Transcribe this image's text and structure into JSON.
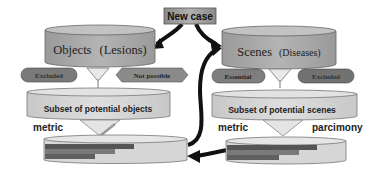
{
  "diagram": {
    "new_case": {
      "label": "New case"
    },
    "objects_db": {
      "title": "Objects",
      "subtitle": "(Lesions)"
    },
    "scenes_db": {
      "title": "Scenes",
      "subtitle": "(Diseases)"
    },
    "left_filters": {
      "excluded": "Excluded",
      "not_possible": "Not possible"
    },
    "right_filters": {
      "essential": "Essential",
      "excluded": "Excluded"
    },
    "left_subset": {
      "label": "Subset of potential objects"
    },
    "right_subset": {
      "label": "Subset of potential scenes"
    },
    "left_metric": {
      "label": "metric"
    },
    "right_metric": {
      "label": "metric"
    },
    "right_parcimony": {
      "label": "parcimony"
    }
  },
  "colors": {
    "cylinder": "#a8a8a8",
    "cylinder_top": "#bdbdbd",
    "slab": "#d4d4d4",
    "pill": "#7a7a7a",
    "hexagon": "#8c8c8c",
    "new_case_box": "#9a9a9a",
    "arrow": "#111111",
    "bar_dark": "#555555",
    "bar_mid": "#777777",
    "bar_light": "#666666"
  }
}
